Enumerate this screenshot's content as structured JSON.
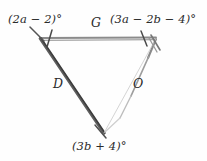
{
  "figure": {
    "type": "triangle-diagram",
    "background_color": "#fefefe",
    "ink_color": "#2b2b2b",
    "angle_labels": {
      "top_left": "(2a − 2)°",
      "top_right": "(3a − 2b − 4)°",
      "bottom": "(3b + 4)°"
    },
    "side_labels": {
      "top": "G",
      "left": "D",
      "right": "O"
    },
    "vertices": {
      "top_left": [
        40,
        38
      ],
      "top_right": [
        156,
        38
      ],
      "bottom": [
        104,
        133
      ]
    },
    "tick_marks": {
      "count": 2,
      "on_side": "G",
      "note": "single tick near each end of top side"
    },
    "stroke_styles": {
      "left_side": "dark-solid",
      "right_side": "light-faded",
      "top_side": "medium-gray"
    }
  }
}
